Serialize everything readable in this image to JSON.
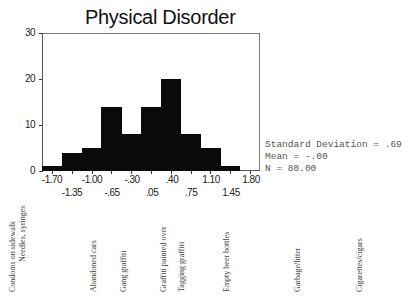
{
  "chart_data": {
    "type": "bar",
    "title": "Physical Disorder",
    "xlabel": "",
    "ylabel": "",
    "ylim": [
      0,
      30
    ],
    "yticks": [
      0,
      10,
      20,
      30
    ],
    "xticks_row1": [
      "-1.70",
      "-1.00",
      "-.30",
      ".40",
      "1.10",
      "1.80"
    ],
    "xticks_row2": [
      "-1.35",
      "-.65",
      ".05",
      ".75",
      "1.45"
    ],
    "categories": [
      "-1.70",
      "-1.35",
      "-1.00",
      "-.65",
      "-.30",
      ".05",
      ".40",
      ".75",
      "1.10",
      "1.45",
      "1.80"
    ],
    "values": [
      1,
      4,
      5,
      14,
      8,
      14,
      20,
      8,
      5,
      1,
      0
    ],
    "grid": false,
    "stats": {
      "std_dev": "Standard Deviation = .69",
      "mean": "Mean = -.00",
      "n": "N = 80.00"
    }
  },
  "item_labels": [
    "Condoms on sidewalk",
    "Needles, syringes",
    "Abandoned cars",
    "Gang graffiti",
    "Graffiti painted over",
    "Tagging graffiti",
    "Empty beer bottles",
    "Garbage/litter",
    "Cigarettes/cigars"
  ]
}
